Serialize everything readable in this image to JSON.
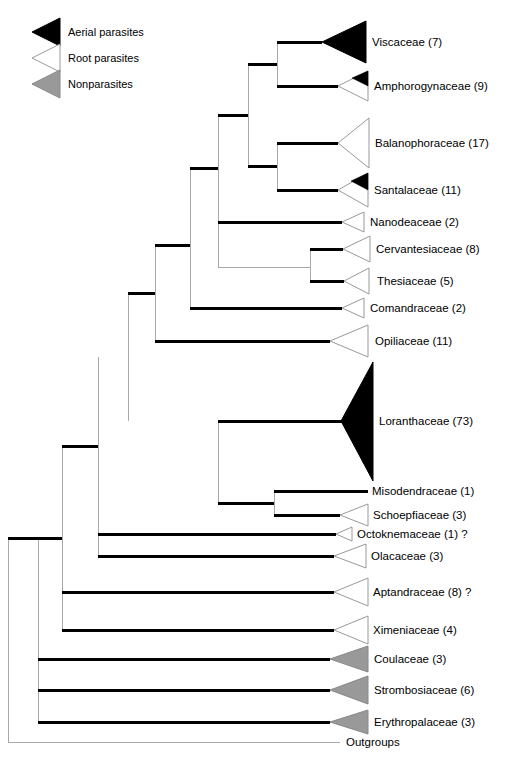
{
  "figure": {
    "kind": "phylogenetic-cladogram",
    "title": "",
    "background": "#ffffff"
  },
  "colors": {
    "aerial_parasite_fill": "#000000",
    "root_parasite_fill": "#ffffff",
    "nonparasite_fill": "#999999",
    "outline": "#808080",
    "branch_thick": "#000000",
    "branch_thin": "#aaaaaa",
    "text": "#000000"
  },
  "legend": {
    "items": [
      {
        "label": "Aerial parasites",
        "fill": "black",
        "icon": "triangle-black-icon"
      },
      {
        "label": "Root parasites",
        "fill": "white",
        "icon": "triangle-white-icon"
      },
      {
        "label": "Nonparasites",
        "fill": "gray",
        "icon": "triangle-gray-icon"
      }
    ]
  },
  "tips": [
    {
      "label": "Viscaceae (7)",
      "name": "Viscaceae",
      "count": 7,
      "fill": "black",
      "shape": "triangle",
      "note": ""
    },
    {
      "label": "Amphorogynaceae (9)",
      "name": "Amphorogynaceae",
      "count": 9,
      "fill": "white-tip-black",
      "shape": "triangle",
      "note": ""
    },
    {
      "label": "Balanophoraceae (17)",
      "name": "Balanophoraceae",
      "count": 17,
      "fill": "white",
      "shape": "triangle",
      "note": ""
    },
    {
      "label": "Santalaceae (11)",
      "name": "Santalaceae",
      "count": 11,
      "fill": "white-tip-black",
      "shape": "triangle",
      "note": ""
    },
    {
      "label": "Nanodeaceae (2)",
      "name": "Nanodeaceae",
      "count": 2,
      "fill": "white",
      "shape": "triangle",
      "note": ""
    },
    {
      "label": "Cervantesiaceae  (8)",
      "name": "Cervantesiaceae",
      "count": 8,
      "fill": "white",
      "shape": "triangle",
      "note": ""
    },
    {
      "label": "Thesiaceae (5)",
      "name": "Thesiaceae",
      "count": 5,
      "fill": "white",
      "shape": "triangle",
      "note": ""
    },
    {
      "label": "Comandraceae (2)",
      "name": "Comandraceae",
      "count": 2,
      "fill": "white",
      "shape": "triangle",
      "note": ""
    },
    {
      "label": "Opiliaceae (11)",
      "name": "Opiliaceae",
      "count": 11,
      "fill": "white",
      "shape": "triangle",
      "note": ""
    },
    {
      "label": "Loranthaceae (73)",
      "name": "Loranthaceae",
      "count": 73,
      "fill": "black",
      "shape": "triangle",
      "note": ""
    },
    {
      "label": "Misodendraceae (1)",
      "name": "Misodendraceae",
      "count": 1,
      "fill": "none",
      "shape": "line",
      "note": ""
    },
    {
      "label": "Schoepfiaceae (3)",
      "name": "Schoepfiaceae",
      "count": 3,
      "fill": "white",
      "shape": "triangle",
      "note": ""
    },
    {
      "label": "Octoknemaceae (1) ?",
      "name": "Octoknemaceae",
      "count": 1,
      "fill": "white",
      "shape": "triangle",
      "note": "?"
    },
    {
      "label": "Olacaceae (3)",
      "name": "Olacaceae",
      "count": 3,
      "fill": "white",
      "shape": "triangle",
      "note": ""
    },
    {
      "label": "Aptandraceae (8) ?",
      "name": "Aptandraceae",
      "count": 8,
      "fill": "white",
      "shape": "triangle",
      "note": "?"
    },
    {
      "label": "Ximeniaceae (4)",
      "name": "Ximeniaceae",
      "count": 4,
      "fill": "white",
      "shape": "triangle",
      "note": ""
    },
    {
      "label": "Coulaceae (3)",
      "name": "Coulaceae",
      "count": 3,
      "fill": "gray",
      "shape": "triangle",
      "note": ""
    },
    {
      "label": "Strombosiaceae (6)",
      "name": "Strombosiaceae",
      "count": 6,
      "fill": "gray",
      "shape": "triangle",
      "note": ""
    },
    {
      "label": "Erythropalaceae (3)",
      "name": "Erythropalaceae",
      "count": 3,
      "fill": "gray",
      "shape": "triangle",
      "note": ""
    },
    {
      "label": "Outgroups",
      "name": "Outgroups",
      "count": null,
      "fill": "none",
      "shape": "line",
      "note": ""
    }
  ]
}
